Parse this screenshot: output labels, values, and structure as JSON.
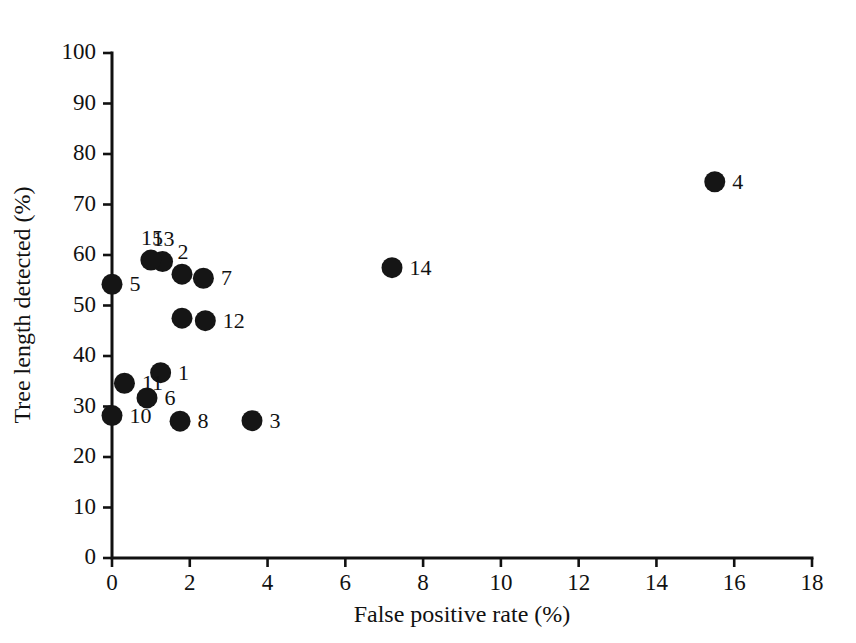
{
  "chart_data": {
    "type": "scatter",
    "title": "",
    "xlabel": "False positive rate (%)",
    "ylabel": "Tree length detected (%)",
    "xlim": [
      0,
      18
    ],
    "ylim": [
      0,
      100
    ],
    "xticks": [
      0,
      2,
      4,
      6,
      8,
      10,
      12,
      14,
      16,
      18
    ],
    "yticks": [
      0,
      10,
      20,
      30,
      40,
      50,
      60,
      70,
      80,
      90,
      100
    ],
    "xtick_labels": [
      "0",
      "2",
      "4",
      "6",
      "8",
      "10",
      "12",
      "14",
      "16",
      "18"
    ],
    "ytick_labels": [
      "0",
      "10",
      "20",
      "30",
      "40",
      "50",
      "60",
      "70",
      "80",
      "90",
      "100"
    ],
    "grid": false,
    "legend": false,
    "marker_color": "#151515",
    "marker_shape": "circle",
    "points": [
      {
        "label": "1",
        "x": 1.25,
        "y": 36.7,
        "label_side": "right"
      },
      {
        "label": "2",
        "x": 1.8,
        "y": 56.2,
        "label_side": "above"
      },
      {
        "label": "3",
        "x": 3.6,
        "y": 27.2,
        "label_side": "right"
      },
      {
        "label": "4",
        "x": 15.5,
        "y": 74.5,
        "label_side": "right"
      },
      {
        "label": "5",
        "x": 0.0,
        "y": 54.2,
        "label_side": "right"
      },
      {
        "label": "6",
        "x": 0.9,
        "y": 31.7,
        "label_side": "right"
      },
      {
        "label": "7",
        "x": 2.35,
        "y": 55.4,
        "label_side": "right"
      },
      {
        "label": "8",
        "x": 1.75,
        "y": 27.1,
        "label_side": "right"
      },
      {
        "label": "9",
        "x": 1.8,
        "y": 47.5,
        "label_side": "right"
      },
      {
        "label": "10",
        "x": 0.0,
        "y": 28.2,
        "label_side": "right"
      },
      {
        "label": "11",
        "x": 0.32,
        "y": 34.6,
        "label_side": "right"
      },
      {
        "label": "12",
        "x": 2.4,
        "y": 47.0,
        "label_side": "right"
      },
      {
        "label": "13",
        "x": 1.3,
        "y": 58.7,
        "label_side": "above"
      },
      {
        "label": "14",
        "x": 7.2,
        "y": 57.5,
        "label_side": "right"
      },
      {
        "label": "15",
        "x": 1.0,
        "y": 59.0,
        "label_side": "above"
      }
    ]
  }
}
